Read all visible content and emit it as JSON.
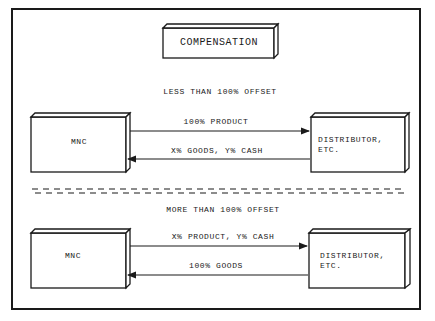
{
  "title": "COMPENSATION",
  "sections": [
    {
      "heading": "LESS THAN 100% OFFSET",
      "left_box": "MNC",
      "right_box_line1": "DISTRIBUTOR,",
      "right_box_line2": "ETC.",
      "arrow_right_label": "100% PRODUCT",
      "arrow_left_label": "X% GOODS, Y% CASH"
    },
    {
      "heading": "MORE THAN 100% OFFSET",
      "left_box": "MNC",
      "right_box_line1": "DISTRIBUTOR,",
      "right_box_line2": "ETC.",
      "arrow_right_label": "X% PRODUCT, Y% CASH",
      "arrow_left_label": "100% GOODS"
    }
  ],
  "colors": {
    "ink": "#1a1a1a",
    "background": "#ffffff"
  }
}
